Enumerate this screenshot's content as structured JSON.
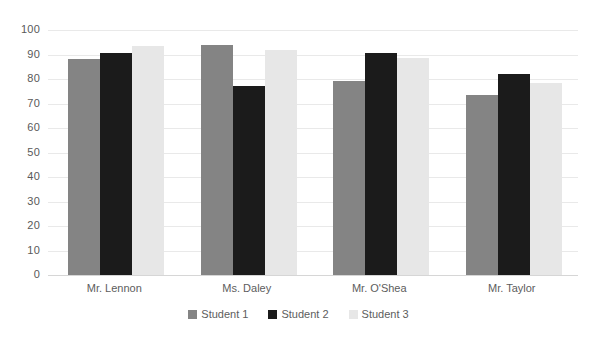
{
  "chart_data": {
    "type": "bar",
    "title": "",
    "xlabel": "",
    "ylabel": "",
    "ylim": [
      0,
      100
    ],
    "y_ticks": [
      0,
      10,
      20,
      30,
      40,
      50,
      60,
      70,
      80,
      90,
      100
    ],
    "y_tick_labels": [
      "0",
      "10",
      "20",
      "30",
      "40",
      "50",
      "60",
      "70",
      "80",
      "90",
      "100"
    ],
    "grid": true,
    "legend_position": "bottom",
    "categories": [
      "Mr. Lennon",
      "Ms. Daley",
      "Mr. O'Shea",
      "Mr. Taylor"
    ],
    "series": [
      {
        "name": "Student 1",
        "color": "#848484",
        "values": [
          88,
          94,
          79,
          73.5
        ]
      },
      {
        "name": "Student 2",
        "color": "#1b1b1b",
        "values": [
          90.5,
          77,
          90.5,
          82
        ]
      },
      {
        "name": "Student 3",
        "color": "#e7e7e7",
        "values": [
          93.5,
          92,
          88.5,
          78.5
        ]
      }
    ]
  },
  "axis": {
    "y_labels": [
      "100",
      "90",
      "80",
      "70",
      "60",
      "50",
      "40",
      "30",
      "20",
      "10",
      "0"
    ],
    "x_labels": [
      "Mr. Lennon",
      "Ms. Daley",
      "Mr. O'Shea",
      "Mr. Taylor"
    ]
  },
  "legend": {
    "items": [
      {
        "label": "Student 1",
        "color": "#848484"
      },
      {
        "label": "Student 2",
        "color": "#1b1b1b"
      },
      {
        "label": "Student 3",
        "color": "#e7e7e7"
      }
    ]
  }
}
